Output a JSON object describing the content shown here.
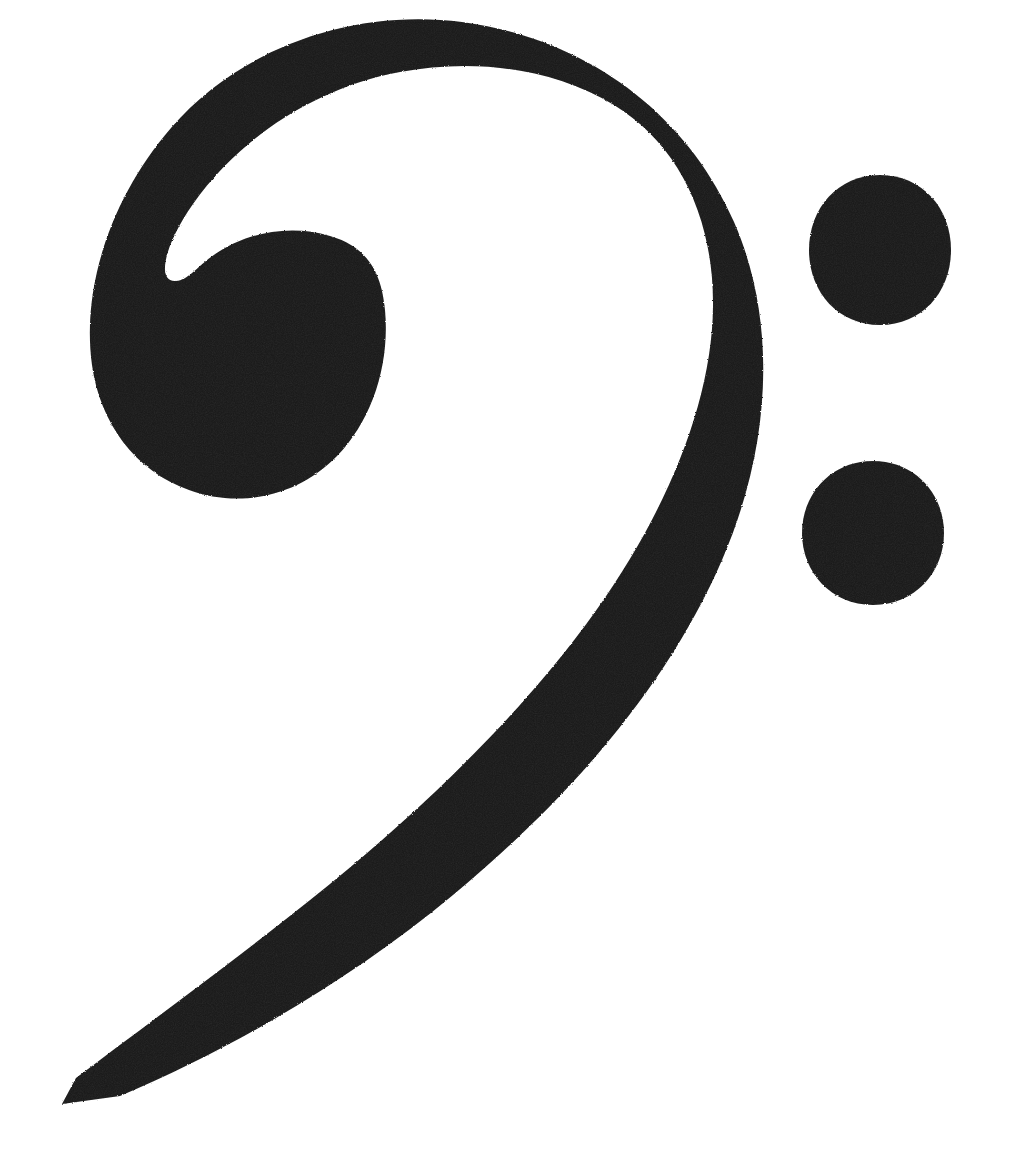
{
  "image": {
    "kind": "music-notation-symbol",
    "symbol_name": "Bass Clef",
    "alt_names": "F clef",
    "unicode_glyph": "𝄢",
    "width": 1018,
    "height": 1172,
    "background_color": "#ffffff",
    "ink_color": "#151515",
    "texture": "grainy scanned print",
    "accessible_label": "Bass clef (F clef) music symbol in black on a white background"
  },
  "parts": {
    "hook": {
      "name": "spiral-hook",
      "description": "Inward curling hook at the top-left of the clef"
    },
    "bulb": {
      "name": "bulb-head",
      "description": "Large round head of the clef resting on the F line",
      "center_x": 240,
      "center_y": 360,
      "radius": 147
    },
    "sweep": {
      "name": "descending-sweep",
      "description": "Long tapering curve sweeping right, down and back to the lower left",
      "rightmost_x": 767,
      "tail_tip_x": 62,
      "tail_tip_y": 1100
    },
    "dots": [
      {
        "name": "upper-dot",
        "center_x": 880,
        "center_y": 250,
        "radius_x": 71,
        "radius_y": 75
      },
      {
        "name": "lower-dot",
        "center_x": 873,
        "center_y": 533,
        "radius_x": 71,
        "radius_y": 72
      }
    ]
  },
  "geometry": {
    "clef_body_path": "M 62 1104 L 76 1078 C 150 1022 240 957 330 884 C 430 802 524 711 595 612 C 668 510 712 401 713 307 C 714 217 678 144 614 105 C 553 68 474 58 400 72 C 318 87 241 136 193 204 C 164 245 156 283 176 281 C 188 280 196 268 211 257 C 245 232 290 224 330 236 C 372 248 382 279 385 310 C 390 365 372 420 337 456 C 296 498 238 508 189 490 C 135 471 100 423 92 365 C 81 285 113 195 171 128 C 240 48 352 8 462 22 C 585 38 686 112 734 222 C 778 323 771 447 722 560 C 668 685 571 797 453 895 C 353 978 236 1047 120 1096 Z",
    "upper_dot_path": "M 880 175 C 922 175 951 208 951 250 C 951 292 922 325 880 325 C 838 325 809 292 809 250 C 809 208 838 175 880 175 Z",
    "lower_dot_path": "M 873 461 C 915 461 944 494 944 533 C 944 572 915 605 873 605 C 831 605 802 572 802 533 C 802 494 831 461 873 461 Z"
  }
}
